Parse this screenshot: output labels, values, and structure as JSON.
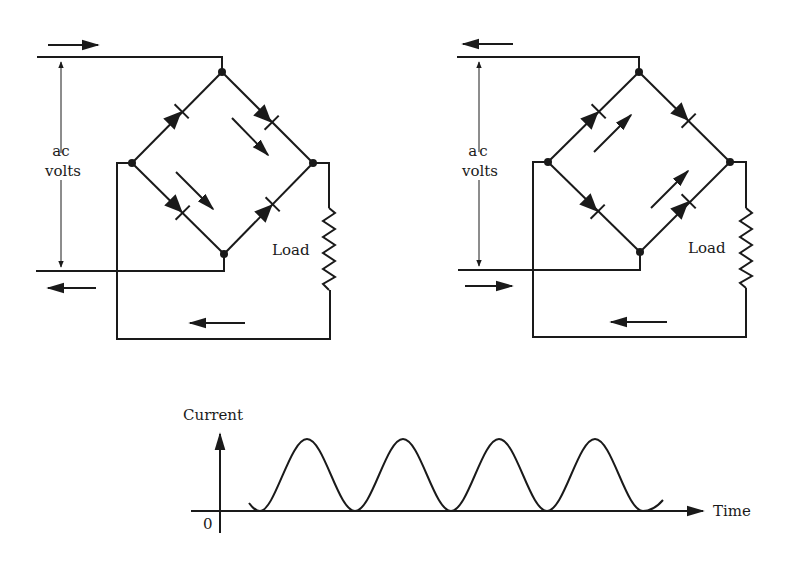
{
  "circuits": [
    {
      "id": "left",
      "phase": "positive half-cycle",
      "voltage_label_line1": "ac",
      "voltage_label_line2": "volts",
      "load_label": "Load",
      "input_top_arrow": "right",
      "input_bottom_arrow": "left",
      "bridge_flow_arrows": "down-right",
      "return_arrow": "left"
    },
    {
      "id": "right",
      "phase": "negative half-cycle",
      "voltage_label_line1": "ac",
      "voltage_label_line2": "volts",
      "load_label": "Load",
      "input_top_arrow": "left",
      "input_bottom_arrow": "right",
      "bridge_flow_arrows": "up-right",
      "return_arrow": "left"
    }
  ],
  "graph": {
    "y_axis_label": "Current",
    "x_axis_label": "Time",
    "origin_label": "0",
    "waveform": "full-wave rectified sine",
    "peaks": 4
  },
  "colors": {
    "ink": "#1a1a1a",
    "background": "#ffffff"
  }
}
